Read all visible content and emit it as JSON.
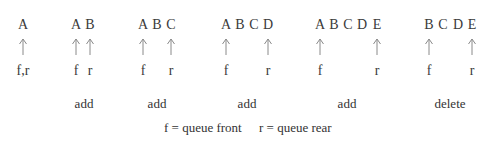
{
  "diagram": {
    "states": [
      {
        "elements": [
          "A"
        ],
        "front_index": 0,
        "rear_index": 0,
        "pointer_label_combined": "f,r",
        "operation": ""
      },
      {
        "elements": [
          "A",
          "B"
        ],
        "front_index": 0,
        "rear_index": 1,
        "front_label": "f",
        "rear_label": "r",
        "operation": "add"
      },
      {
        "elements": [
          "A",
          "B",
          "C"
        ],
        "front_index": 0,
        "rear_index": 2,
        "front_label": "f",
        "rear_label": "r",
        "operation": "add"
      },
      {
        "elements": [
          "A",
          "B",
          "C",
          "D"
        ],
        "front_index": 0,
        "rear_index": 3,
        "front_label": "f",
        "rear_label": "r",
        "operation": "add"
      },
      {
        "elements": [
          "A",
          "B",
          "C",
          "D",
          "E"
        ],
        "front_index": 0,
        "rear_index": 4,
        "front_label": "f",
        "rear_label": "r",
        "operation": "add"
      },
      {
        "elements": [
          "B",
          "C",
          "D",
          "E"
        ],
        "front_index": 0,
        "rear_index": 3,
        "front_label": "f",
        "rear_label": "r",
        "operation": "delete"
      }
    ],
    "legend": {
      "front": "f = queue front",
      "rear": "r = queue rear"
    },
    "arrow_color": "#8a8a8a",
    "text_color": "#333333"
  }
}
